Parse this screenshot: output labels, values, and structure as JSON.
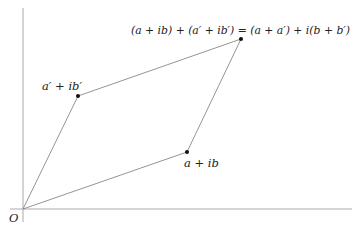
{
  "diagram": {
    "colors": {
      "axis": "#aaaaaa",
      "edge": "#888888",
      "point": "#111111",
      "text": "#222222"
    },
    "origin": {
      "label": "O",
      "x": 23,
      "y": 209
    },
    "axes": {
      "horizontal": {
        "x1": 10,
        "y1": 209,
        "x2": 352,
        "y2": 209
      },
      "vertical": {
        "x1": 23,
        "y1": 8,
        "x2": 23,
        "y2": 222
      }
    },
    "points": [
      {
        "id": "z1",
        "label": "a + ib",
        "x": 187,
        "y": 152
      },
      {
        "id": "z2",
        "label": "a′ + ib′",
        "x": 78,
        "y": 96
      },
      {
        "id": "sum",
        "label": "(a + ib) + (a′ + ib′) = (a + a′) + i(b + b′)",
        "x": 241,
        "y": 39
      }
    ],
    "labels": {
      "origin": "O",
      "z1": "a + ib",
      "z2": "a′ + ib′",
      "sum": "(a + ib) + (a′ + ib′) = (a + a′) + i(b + b′)"
    }
  }
}
